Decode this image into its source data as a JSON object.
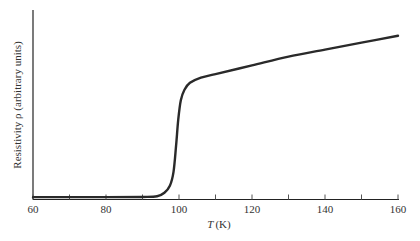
{
  "chart_data": {
    "type": "line",
    "title": "",
    "xlabel": "T (K)",
    "xlabel_italic": "T",
    "xlabel_unit": "(K)",
    "ylabel": "Resistivity ρ (arbitrary units)",
    "xlim": [
      60,
      160
    ],
    "ylim": [
      0,
      1
    ],
    "x_ticks_major": [
      60,
      80,
      100,
      120,
      140,
      160
    ],
    "x_ticks_minor": [
      70,
      90,
      110,
      130,
      150
    ],
    "y_ticks": [],
    "grid": false,
    "legend": null,
    "series": [
      {
        "name": "Resistivity",
        "color": "#2a2a2a",
        "x": [
          60,
          80,
          90,
          94,
          96,
          97.5,
          98.5,
          99.2,
          99.8,
          100.5,
          101.5,
          103,
          106,
          110,
          120,
          130,
          140,
          150,
          160
        ],
        "y": [
          0.005,
          0.005,
          0.006,
          0.01,
          0.03,
          0.07,
          0.15,
          0.3,
          0.45,
          0.56,
          0.62,
          0.66,
          0.69,
          0.71,
          0.76,
          0.81,
          0.85,
          0.89,
          0.93
        ]
      }
    ],
    "annotations": [
      "Sharp drop to zero resistivity near T ≈ 100 K (superconducting transition)"
    ]
  }
}
